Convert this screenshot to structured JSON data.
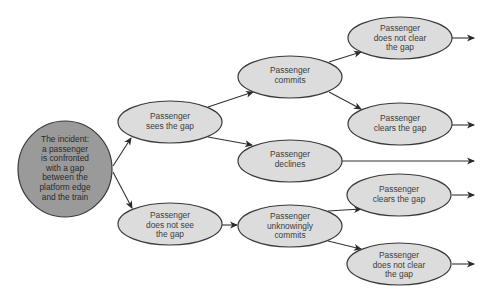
{
  "diagram": {
    "type": "event-tree",
    "colors": {
      "node_fill": "#dcdcdc",
      "root_fill": "#9a9a9a",
      "stroke": "#3a3a3a",
      "text": "#3c3c3c"
    },
    "nodes": {
      "root": {
        "label": "The incident:\na passenger\nis confronted\nwith a gap\nbetween the\nplatform edge\nand the train"
      },
      "sees_gap": {
        "label": "Passenger\nsees the gap"
      },
      "not_see_gap": {
        "label": "Passenger\ndoes not see\nthe gap"
      },
      "commits": {
        "label": "Passenger\ncommits"
      },
      "declines": {
        "label": "Passenger\ndeclines"
      },
      "unknowingly_commits": {
        "label": "Passenger\nunknowingly\ncommits"
      },
      "commits_not_clear": {
        "label": "Passenger\ndoes not clear\nthe gap"
      },
      "commits_clears": {
        "label": "Passenger\nclears the gap"
      },
      "unknowing_clears": {
        "label": "Passenger\nclears the gap"
      },
      "unknowing_not_clear": {
        "label": "Passenger\ndoes not clear\nthe gap"
      }
    },
    "edges": [
      {
        "from": "root",
        "to": "sees_gap"
      },
      {
        "from": "root",
        "to": "not_see_gap"
      },
      {
        "from": "sees_gap",
        "to": "commits"
      },
      {
        "from": "sees_gap",
        "to": "declines"
      },
      {
        "from": "not_see_gap",
        "to": "unknowingly_commits"
      },
      {
        "from": "commits",
        "to": "commits_not_clear"
      },
      {
        "from": "commits",
        "to": "commits_clears"
      },
      {
        "from": "unknowingly_commits",
        "to": "unknowing_clears"
      },
      {
        "from": "unknowingly_commits",
        "to": "unknowing_not_clear"
      },
      {
        "from": "commits_not_clear",
        "to": "outcome"
      },
      {
        "from": "commits_clears",
        "to": "outcome"
      },
      {
        "from": "declines",
        "to": "outcome"
      },
      {
        "from": "unknowing_clears",
        "to": "outcome"
      },
      {
        "from": "unknowing_not_clear",
        "to": "outcome"
      }
    ]
  }
}
